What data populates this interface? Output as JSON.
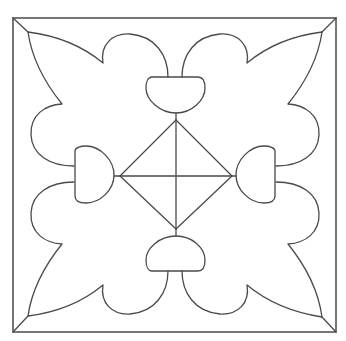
{
  "image": {
    "kind": "coloring-page",
    "subject": "ornamental square tile with four fleur-like leaves, four knobs and a central diamond",
    "background_color": "#ffffff",
    "line_color": "#4a4a4a"
  },
  "frame": {
    "x1": 13,
    "y1": 18,
    "x2": 336,
    "y2": 332
  },
  "center": {
    "x": 175,
    "y": 175
  },
  "diamond": {
    "top": [
      176,
      120
    ],
    "right": [
      232,
      176
    ],
    "bottom": [
      176,
      229
    ],
    "left": [
      120,
      176
    ]
  },
  "corner_tips": {
    "tl": [
      28,
      32
    ],
    "tr": [
      322,
      32
    ],
    "bl": [
      28,
      316
    ],
    "br": [
      322,
      317
    ]
  }
}
